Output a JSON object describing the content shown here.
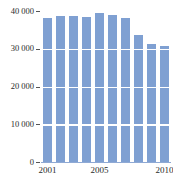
{
  "chart_data": {
    "type": "bar",
    "title": "",
    "subtitle": "",
    "xlabel": "",
    "ylabel": "",
    "categories": [
      "2001",
      "2002",
      "2003",
      "2004",
      "2005",
      "2006",
      "2007",
      "2008",
      "2009",
      "2010"
    ],
    "values": [
      38200,
      38700,
      38700,
      38500,
      39400,
      39000,
      38200,
      33700,
      31300,
      30800
    ],
    "series": [
      {
        "name": "",
        "values": [
          38200,
          38700,
          38700,
          38500,
          39400,
          39000,
          38200,
          33700,
          31300,
          30800
        ]
      }
    ],
    "ylim": [
      0,
      40000
    ],
    "y_ticks": [
      0,
      10000,
      20000,
      30000,
      40000
    ],
    "y_tick_labels": [
      "0",
      "10 000",
      "20 000",
      "30 000",
      "40 000"
    ],
    "x_tick_labels": [
      "2001",
      "2005",
      "2010"
    ],
    "x_tick_categories": [
      "2001",
      "2005",
      "2010"
    ],
    "grid": true,
    "grid_color": "#ffffff",
    "legend": false,
    "legend_position": "none",
    "bar_color": "#7fa0d2",
    "axis_color": "#8fa9d4",
    "text_color": "#2b2b2b",
    "background": "#ffffff"
  }
}
